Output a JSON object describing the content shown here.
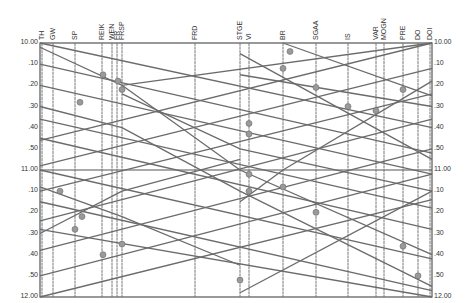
{
  "diagram": {
    "type": "train-graph (time-distance diagram)",
    "colors": {
      "line": "#6b6b6b",
      "frame": "#555555",
      "station": "#777777",
      "background": "#ffffff"
    },
    "plot": {
      "left": 40,
      "right": 432,
      "top": 43,
      "bottom": 297
    },
    "stations": [
      {
        "code": "TH",
        "x": 42
      },
      {
        "code": "GW",
        "x": 53
      },
      {
        "code": "SP",
        "x": 75
      },
      {
        "code": "REIK",
        "x": 102
      },
      {
        "code": "WEN",
        "x": 112
      },
      {
        "code": "FR",
        "x": 117
      },
      {
        "code": "FRSP",
        "x": 122
      },
      {
        "code": "FRD",
        "x": 195
      },
      {
        "code": "STGE",
        "x": 240
      },
      {
        "code": "VI",
        "x": 249
      },
      {
        "code": "BR",
        "x": 283
      },
      {
        "code": "SGAA",
        "x": 316
      },
      {
        "code": "IS",
        "x": 348
      },
      {
        "code": "VAR",
        "x": 376
      },
      {
        "code": "MOGN",
        "x": 384
      },
      {
        "code": "PRE",
        "x": 403
      },
      {
        "code": "DO",
        "x": 418
      },
      {
        "code": "DOI",
        "x": 430
      }
    ],
    "time_axis_left": [
      "10.00",
      ".10",
      ".20",
      ".30",
      ".40",
      ".50",
      "11.00",
      ".10",
      ".20",
      ".30",
      ".40",
      ".50",
      "12.00"
    ],
    "time_axis_right": [
      "10.00",
      ".10",
      ".20",
      ".30",
      ".40",
      ".50",
      "11.00",
      ".10",
      ".20",
      ".30",
      ".40",
      ".50",
      "12.00"
    ],
    "time_range": [
      "10.00",
      "12.00"
    ],
    "train_labels": [
      "1651",
      "1063",
      "4261",
      "820",
      "1026",
      "3017",
      "21",
      "2112",
      "1056",
      "1064",
      "3760"
    ]
  }
}
